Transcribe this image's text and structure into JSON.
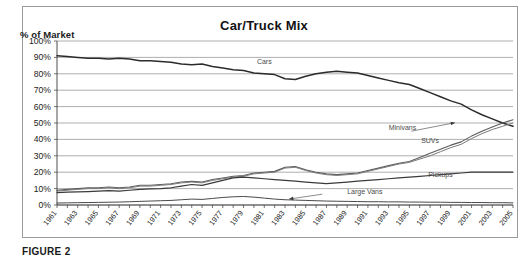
{
  "figure": {
    "caption": "FIGURE 2"
  },
  "chart_data": {
    "type": "line",
    "title": "Car/Truck Mix",
    "ylabel": "% of Market",
    "xlabel": "",
    "ylim": [
      0,
      100
    ],
    "ytick_labels": [
      "0%",
      "10%",
      "20%",
      "30%",
      "40%",
      "50%",
      "60%",
      "70%",
      "80%",
      "90%",
      "100%"
    ],
    "ytick_values": [
      0,
      10,
      20,
      30,
      40,
      50,
      60,
      70,
      80,
      90,
      100
    ],
    "grid": true,
    "legend_position": "inline-annotations",
    "x": [
      1961,
      1962,
      1963,
      1964,
      1965,
      1966,
      1967,
      1968,
      1969,
      1970,
      1971,
      1972,
      1973,
      1974,
      1975,
      1976,
      1977,
      1978,
      1979,
      1980,
      1981,
      1982,
      1983,
      1984,
      1985,
      1986,
      1987,
      1988,
      1989,
      1990,
      1991,
      1992,
      1993,
      1994,
      1995,
      1996,
      1997,
      1998,
      1999,
      2000,
      2001,
      2002,
      2003,
      2004,
      2005
    ],
    "xtick_labels": [
      "1961",
      "1963",
      "1965",
      "1967",
      "1969",
      "1971",
      "1973",
      "1975",
      "1977",
      "1979",
      "1981",
      "1983",
      "1985",
      "1987",
      "1989",
      "1991",
      "1993",
      "1995",
      "1997",
      "1999",
      "2001",
      "2003",
      "2005"
    ],
    "series": [
      {
        "name": "Cars",
        "color": "#2b2b2b",
        "label_x": 1981,
        "label_y": 86,
        "values": [
          91,
          90.5,
          90,
          89.5,
          89.5,
          89,
          89.5,
          89,
          88,
          88,
          87.5,
          87,
          86,
          85.5,
          86,
          84.5,
          83.5,
          82.5,
          82,
          80.5,
          80,
          79.5,
          77,
          76.5,
          78.5,
          80,
          81,
          81.5,
          81,
          80.5,
          79,
          77.5,
          76,
          74.5,
          73.5,
          71,
          68.5,
          66,
          63.5,
          61.5,
          58,
          55,
          52.5,
          50,
          48
        ]
      },
      {
        "name": "Minivans",
        "color": "#5c5c5c",
        "label_x": 1993,
        "label_y": 46,
        "values": [
          9,
          9.5,
          10,
          10.5,
          10.5,
          11,
          10.5,
          11,
          12,
          12,
          12.5,
          13,
          14,
          14.5,
          14,
          15.5,
          16.5,
          17.5,
          18,
          19.5,
          20,
          20.5,
          23,
          23.5,
          21.5,
          20,
          19,
          18.5,
          19,
          19.5,
          21,
          22.5,
          24,
          25.5,
          26.5,
          29,
          31.5,
          34,
          36.5,
          38.5,
          42,
          45,
          47.5,
          50,
          52
        ]
      },
      {
        "name": "SUVs",
        "color": "#7a7a7a",
        "label_x": 1997,
        "label_y": 38,
        "values": [
          8.5,
          9,
          9.5,
          10,
          10,
          10.5,
          10,
          10.5,
          11.5,
          11.5,
          12,
          12.5,
          13.5,
          14,
          13.5,
          15,
          16,
          17,
          17.5,
          19,
          19.5,
          20,
          22.5,
          23,
          21,
          19.5,
          18.5,
          18,
          18.5,
          19,
          20.5,
          22,
          23.5,
          25,
          26,
          28,
          30,
          32.5,
          35,
          37,
          40.5,
          43.5,
          46,
          48,
          50
        ]
      },
      {
        "name": "Pickups",
        "color": "#3a3a3a",
        "label_x": 1998,
        "label_y": 17,
        "values": [
          7.5,
          7.8,
          8,
          8.2,
          8.5,
          8.8,
          8.5,
          9,
          9.5,
          9.8,
          10,
          10.5,
          11.5,
          12.5,
          12,
          13.5,
          15,
          16.5,
          17,
          16.5,
          16,
          15.5,
          15,
          14.5,
          14,
          13.5,
          13,
          13.5,
          14,
          14.5,
          15,
          15.5,
          16,
          16.5,
          17,
          17.5,
          18,
          18.5,
          19,
          19.5,
          20,
          20,
          20,
          20,
          20
        ]
      },
      {
        "name": "Large Vans",
        "color": "#4a4a4a",
        "label_x": 1989,
        "label_y": 7,
        "values": [
          1.2,
          1.3,
          1.4,
          1.5,
          1.6,
          1.7,
          1.8,
          2,
          2.2,
          2.4,
          2.6,
          2.8,
          3.2,
          3.6,
          3.4,
          4,
          4.6,
          5,
          5.2,
          4.8,
          4.2,
          3.6,
          3.2,
          3,
          2.8,
          2.6,
          2.4,
          2.3,
          2.2,
          2.1,
          2,
          2,
          1.9,
          1.9,
          1.8,
          1.8,
          1.7,
          1.7,
          1.6,
          1.6,
          1.5,
          1.5,
          1.4,
          1.4,
          1.3
        ]
      }
    ]
  }
}
